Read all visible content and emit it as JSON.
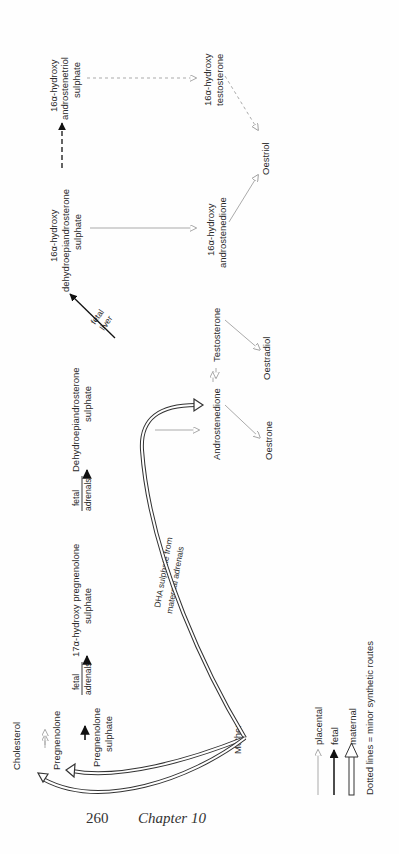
{
  "diagram": {
    "orientation": "rotated-90-ccw",
    "nodes": {
      "cholesterol": "Cholesterol",
      "pregnenolone": "Pregnenolone",
      "pregnenolone_sulphate": [
        "Pregnenolone",
        "sulphate"
      ],
      "hydroxy17_pregnenolone_sulphate": [
        "17α-hydroxy pregnenolone",
        "sulphate"
      ],
      "dhea_sulphate": [
        "Dehydroepiandrosterone",
        "sulphate"
      ],
      "hydroxy16_dhea_sulphate": [
        "16α-hydroxy",
        "dehydroepiandrosterone",
        "sulphate"
      ],
      "hydroxy16_androstenetriol_sulphate": [
        "16α-hydroxy",
        "androstenetriol",
        "sulphate"
      ],
      "androstenedione": "Androstenedione",
      "testosterone": "Testosterone",
      "oestrone": "Oestrone",
      "oestradiol": "Oestradiol",
      "hydroxy16_androstenedione": [
        "16α-hydroxy",
        "androstenedione"
      ],
      "hydroxy16_testosterone": [
        "16α-hydroxy",
        "testosterone"
      ],
      "oestriol": "Oestriol",
      "mother": "Mother"
    },
    "edge_labels": {
      "fetal_adrenals_1": [
        "fetal",
        "adrenals"
      ],
      "fetal_adrenals_2": [
        "fetal",
        "adrenals"
      ],
      "fetal_liver": [
        "fetal",
        "liver"
      ],
      "dha_from_maternal": [
        "DHA sulphate from",
        "maternal adrenals"
      ]
    },
    "legend": {
      "placental": "placental",
      "fetal": "fetal",
      "maternal": "maternal",
      "dotted_note": "Dotted lines = minor synthetic routes"
    },
    "colors": {
      "placental_arrow": "#a8a8a8",
      "fetal_arrow": "#111111",
      "maternal_arrow": "#333333",
      "text": "#2a2a2a"
    }
  },
  "footer": {
    "page_number": "260",
    "chapter": "Chapter 10"
  }
}
